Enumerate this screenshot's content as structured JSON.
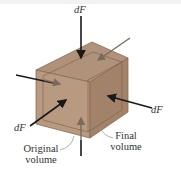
{
  "diagram": {
    "labels": {
      "force_top": "dF",
      "force_right": "dF",
      "force_left": "dF",
      "original_volume_line1": "Original",
      "original_volume_line2": "volume",
      "final_volume_line1": "Final",
      "final_volume_line2": "volume"
    },
    "colors": {
      "cube_top": "#b0917a",
      "cube_front": "#b89a80",
      "cube_right": "#a3826a",
      "edge": "#8a6a52",
      "arrow_dark": "#1a1a1a",
      "arrow_gray": "#7a6a5e"
    }
  }
}
